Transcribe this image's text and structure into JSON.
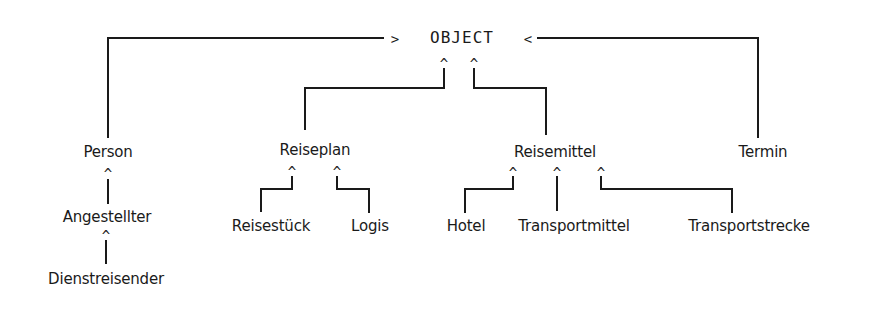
{
  "diagram": {
    "type": "class-hierarchy",
    "root": {
      "label": "OBJECT",
      "left_arrow": ">",
      "right_arrow": "<"
    },
    "caret": "^",
    "nodes": {
      "person": "Person",
      "angestellter": "Angestellter",
      "dienstreisender": "Dienstreisender",
      "reiseplan": "Reiseplan",
      "reisestueck": "Reisestück",
      "logis": "Logis",
      "reisemittel": "Reisemittel",
      "hotel": "Hotel",
      "transportmittel": "Transportmittel",
      "transportstrecke": "Transportstrecke",
      "termin": "Termin"
    },
    "edges": [
      {
        "child": "Person",
        "parent": "OBJECT"
      },
      {
        "child": "Termin",
        "parent": "OBJECT"
      },
      {
        "child": "Reiseplan",
        "parent": "OBJECT"
      },
      {
        "child": "Reisemittel",
        "parent": "OBJECT"
      },
      {
        "child": "Angestellter",
        "parent": "Person"
      },
      {
        "child": "Dienstreisender",
        "parent": "Angestellter"
      },
      {
        "child": "Reisestück",
        "parent": "Reiseplan"
      },
      {
        "child": "Logis",
        "parent": "Reiseplan"
      },
      {
        "child": "Hotel",
        "parent": "Reisemittel"
      },
      {
        "child": "Transportmittel",
        "parent": "Reisemittel"
      },
      {
        "child": "Transportstrecke",
        "parent": "Reisemittel"
      }
    ],
    "colors": {
      "line": "#1a1a1a",
      "text": "#1a1a1a",
      "background": "#ffffff"
    }
  }
}
